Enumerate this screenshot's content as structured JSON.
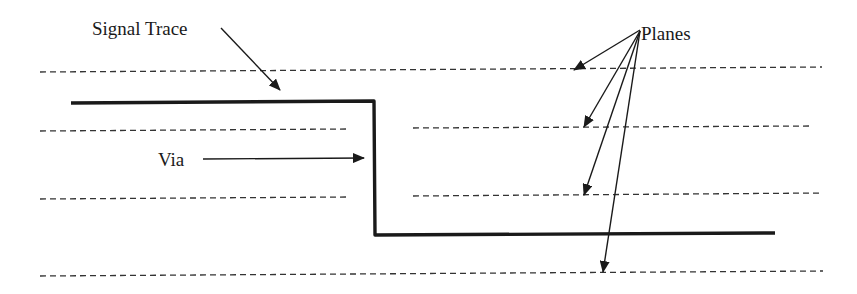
{
  "diagram": {
    "labels": {
      "signal_trace": "Signal Trace",
      "via": "Via",
      "planes": "Planes"
    },
    "colors": {
      "background": "#ffffff",
      "ink": "#1a1a1a",
      "dashed_plane": "#333333"
    },
    "planes": [
      {
        "name": "plane-1",
        "y": 71,
        "segments": [
          [
            40,
            822
          ]
        ]
      },
      {
        "name": "plane-2",
        "y": 129,
        "segments": [
          [
            40,
            347
          ],
          [
            413,
            810
          ]
        ]
      },
      {
        "name": "plane-3",
        "y": 196,
        "segments": [
          [
            40,
            347
          ],
          [
            413,
            823
          ]
        ]
      },
      {
        "name": "plane-4",
        "y": 272,
        "segments": [
          [
            40,
            823
          ]
        ]
      }
    ],
    "signal_trace": {
      "points": [
        [
          71,
          102
        ],
        [
          373,
          102
        ],
        [
          373,
          235
        ],
        [
          775,
          235
        ]
      ]
    }
  }
}
